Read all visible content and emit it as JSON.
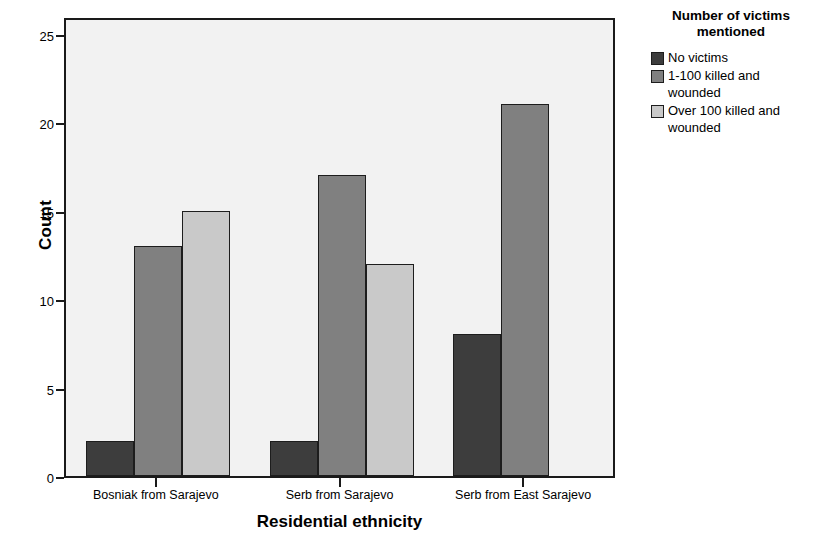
{
  "chart_data": {
    "type": "bar",
    "title": "",
    "subtitle": "",
    "xlabel": "Residential ethnicity",
    "ylabel": "Count",
    "categories": [
      "Bosniak from Sarajevo",
      "Serb from Sarajevo",
      "Serb from East Sarajevo"
    ],
    "series": [
      {
        "name": "No victims",
        "values": [
          2,
          2,
          8
        ],
        "color": "#3d3d3d"
      },
      {
        "name": "1-100 killed and wounded",
        "values": [
          13,
          17,
          21
        ],
        "color": "#808080"
      },
      {
        "name": "Over 100 killed and wounded",
        "values": [
          15,
          12,
          0
        ],
        "color": "#c9c9c9"
      }
    ],
    "ylim": [
      0,
      26
    ],
    "yticks": [
      0,
      5,
      10,
      15,
      20,
      25
    ],
    "ytick_labels": [
      "0",
      "5",
      "10",
      "15",
      "20",
      "25"
    ],
    "grid": false,
    "legend_position": "right",
    "legend_title": "Number of victims mentioned",
    "plot_background": "#f2f2f2",
    "axis_color": "#1a1a1a"
  },
  "legend": {
    "title_line1": "Number of victims",
    "title_line2": "mentioned",
    "entries": [
      {
        "label": "No victims"
      },
      {
        "label": "1-100 killed and wounded"
      },
      {
        "label": "Over 100 killed and wounded"
      }
    ]
  },
  "axes": {
    "y_title": "Count",
    "x_title": "Residential ethnicity"
  }
}
